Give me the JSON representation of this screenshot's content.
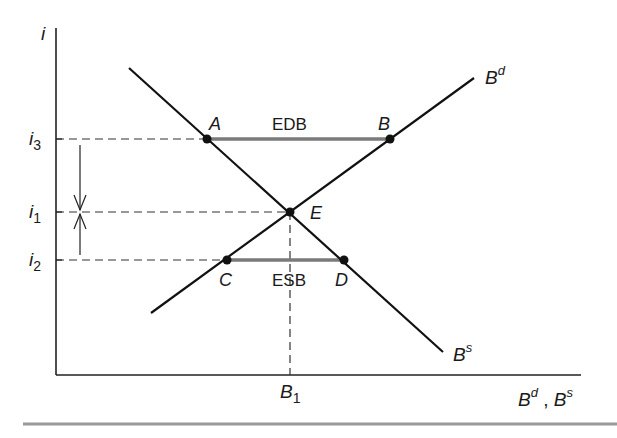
{
  "diagram": {
    "type": "bond-market-supply-demand",
    "axes": {
      "y_label": "i",
      "x_label_main1": "B",
      "x_label_sup1": "d",
      "x_label_sep": " , ",
      "x_label_main2": "B",
      "x_label_sup2": "s"
    },
    "y_ticks": [
      {
        "main": "i",
        "sub": "3",
        "level": "i3"
      },
      {
        "main": "i",
        "sub": "1",
        "level": "i1"
      },
      {
        "main": "i",
        "sub": "2",
        "level": "i2"
      }
    ],
    "x_tick": {
      "main": "B",
      "sub": "1"
    },
    "curves": {
      "demand": {
        "main": "B",
        "sup": "d"
      },
      "supply": {
        "main": "B",
        "sup": "s"
      }
    },
    "points": {
      "A": "A",
      "B": "B",
      "C": "C",
      "D": "D",
      "E": "E"
    },
    "segments": {
      "excess_demand": "EDB",
      "excess_supply": "ESB"
    },
    "colors": {
      "line": "#111111",
      "segment": "#7a7a7a",
      "dash": "#333333",
      "rule": "#8a8a8a"
    }
  }
}
